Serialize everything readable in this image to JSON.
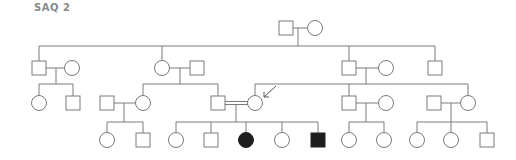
{
  "title": "SAQ 2",
  "colors": {
    "line": "#7a7a7a",
    "affected": "#1e1e1e",
    "unaffected": "#ffffff",
    "title": "#888888"
  },
  "legend": {
    "square": "male",
    "circle": "female",
    "filled": "affected",
    "double_line": "consanguineous mating",
    "arrow": "proband"
  },
  "generations": [
    {
      "label": "I",
      "individuals": [
        {
          "id": "I-1",
          "sex": "male",
          "affected": false
        },
        {
          "id": "I-2",
          "sex": "female",
          "affected": false
        }
      ]
    },
    {
      "label": "II",
      "individuals": [
        {
          "id": "II-1",
          "sex": "male",
          "affected": false
        },
        {
          "id": "II-1s",
          "sex": "female",
          "affected": false,
          "spouse": true
        },
        {
          "id": "II-2",
          "sex": "female",
          "affected": false
        },
        {
          "id": "II-2s",
          "sex": "male",
          "affected": false,
          "spouse": true
        },
        {
          "id": "II-3",
          "sex": "male",
          "affected": false
        },
        {
          "id": "II-3s",
          "sex": "female",
          "affected": false,
          "spouse": true
        },
        {
          "id": "II-4",
          "sex": "male",
          "affected": false
        }
      ]
    },
    {
      "label": "III",
      "individuals": [
        {
          "id": "III-1",
          "sex": "female",
          "affected": false
        },
        {
          "id": "III-2",
          "sex": "male",
          "affected": false
        },
        {
          "id": "III-3s",
          "sex": "male",
          "affected": false,
          "spouse": true
        },
        {
          "id": "III-3",
          "sex": "female",
          "affected": false
        },
        {
          "id": "III-4",
          "sex": "male",
          "affected": false,
          "consanguineous": true
        },
        {
          "id": "III-5",
          "sex": "female",
          "affected": false,
          "proband": true,
          "consanguineous": true
        },
        {
          "id": "III-6",
          "sex": "male",
          "affected": false
        },
        {
          "id": "III-6s",
          "sex": "female",
          "affected": false,
          "spouse": true
        },
        {
          "id": "III-7s",
          "sex": "male",
          "affected": false,
          "spouse": true
        },
        {
          "id": "III-7",
          "sex": "female",
          "affected": false
        }
      ]
    },
    {
      "label": "IV",
      "individuals": [
        {
          "id": "IV-1",
          "sex": "female",
          "affected": false
        },
        {
          "id": "IV-2",
          "sex": "male",
          "affected": false
        },
        {
          "id": "IV-3",
          "sex": "female",
          "affected": false
        },
        {
          "id": "IV-4",
          "sex": "male",
          "affected": false
        },
        {
          "id": "IV-5",
          "sex": "female",
          "affected": true
        },
        {
          "id": "IV-6",
          "sex": "female",
          "affected": false
        },
        {
          "id": "IV-7",
          "sex": "male",
          "affected": true
        },
        {
          "id": "IV-8",
          "sex": "female",
          "affected": false
        },
        {
          "id": "IV-9",
          "sex": "female",
          "affected": false
        },
        {
          "id": "IV-10",
          "sex": "female",
          "affected": false
        },
        {
          "id": "IV-11",
          "sex": "female",
          "affected": false
        },
        {
          "id": "IV-12",
          "sex": "male",
          "affected": false
        }
      ]
    }
  ]
}
